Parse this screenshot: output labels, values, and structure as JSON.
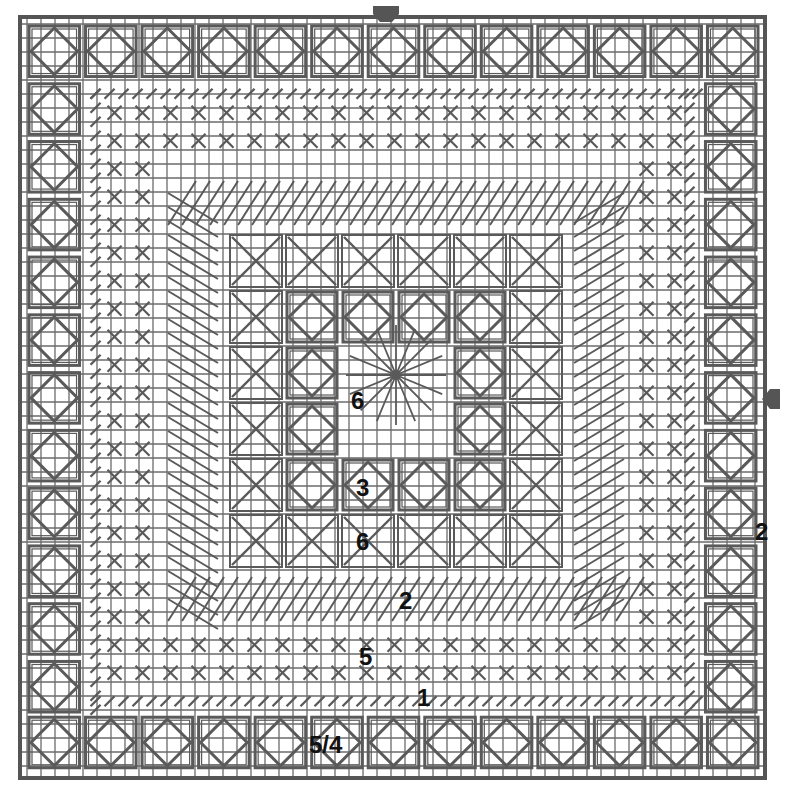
{
  "chart": {
    "frame": {
      "left": 20,
      "top": 17,
      "right": 765,
      "bottom": 778
    },
    "grid_spacing": 14,
    "colors": {
      "line": "#6b6b6b",
      "stitch": "#5a5a5a",
      "frame": "#555555",
      "background": "#ffffff",
      "label": "#111111"
    },
    "border": {
      "stitch": "square-with-diamond",
      "count_per_side": 13,
      "cell_size": 56
    },
    "inner_rows": {
      "cross_stitch_area": "alternating crosses",
      "slant_area": "diagonal slant stitches"
    },
    "center_motif": {
      "rows": 6,
      "cols": 6,
      "origin": [
        228,
        233
      ],
      "cell_size": 56,
      "center_stitch": "star / eyelet"
    }
  },
  "markers": [
    {
      "name": "top-center-arrow",
      "direction": "down"
    },
    {
      "name": "right-center-arrow",
      "direction": "left"
    }
  ],
  "labels": [
    {
      "id": "center-star",
      "text": "6",
      "x": 351,
      "y": 389
    },
    {
      "id": "center-block",
      "text": "3",
      "x": 356,
      "y": 476
    },
    {
      "id": "lower-block",
      "text": "6",
      "x": 356,
      "y": 530
    },
    {
      "id": "slant",
      "text": "2",
      "x": 399,
      "y": 589
    },
    {
      "id": "cross",
      "text": "5",
      "x": 359,
      "y": 645
    },
    {
      "id": "edge",
      "text": "1",
      "x": 417,
      "y": 686
    },
    {
      "id": "border",
      "text": "5/4",
      "x": 309,
      "y": 733
    },
    {
      "id": "right-border",
      "text": "2",
      "x": 755,
      "y": 520
    }
  ]
}
